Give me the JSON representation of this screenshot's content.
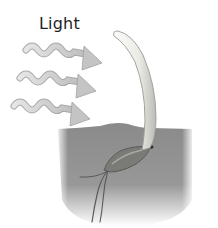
{
  "diagram": {
    "labels": {
      "light": "Light"
    },
    "elements": {
      "light_rays": {
        "count": 3,
        "direction": "left-to-right, slightly downward",
        "style": "wavy arrows",
        "fill": "#d2d2d2",
        "stroke": "#a8a8a8"
      },
      "shoot": {
        "description": "coleoptile curving toward the light source",
        "fill": "#f1f1ec",
        "stroke": "#9a9a96"
      },
      "seed": {
        "description": "seed partially buried in soil",
        "fill": "#7a7a76"
      },
      "roots": {
        "count": 3,
        "stroke": "#5a5a5a"
      },
      "soil": {
        "fill": "#8c8c8c",
        "fade": "bottom"
      }
    }
  }
}
